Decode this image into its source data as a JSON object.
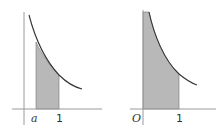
{
  "figures": [
    {
      "id": "left",
      "description": "Decreasing curve over positive x, area shaded from x=a to x=1",
      "x_labels": [
        "a",
        "1"
      ],
      "shaded_from": "a",
      "shaded_to": "1"
    },
    {
      "id": "right",
      "description": "Decreasing curve asymptotic to y-axis, area shaded from x=0 to x=1",
      "x_labels": [
        "O",
        "1"
      ],
      "shaded_from": "0",
      "shaded_to": "1"
    }
  ],
  "colors": {
    "axis": "#999999",
    "curve": "#333333",
    "shade": "#b8b8b8"
  }
}
